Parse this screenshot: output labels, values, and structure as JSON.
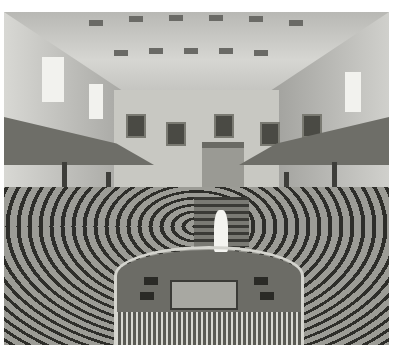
{
  "image": {
    "kind": "photograph",
    "style": "black-and-white",
    "subject": "historic tiered lecture theatre interior",
    "elements": [
      "coffered barrel-vaulted ceiling",
      "upper galleries with balustrades on both sides",
      "twin staircases flanking back wall",
      "five framed portraits on back wall",
      "pedimented doorway at center of back wall",
      "white bust on pedestal at center",
      "curved tiered wooden benches",
      "central well with table and chairs",
      "horseshoe balustrade around well"
    ]
  }
}
